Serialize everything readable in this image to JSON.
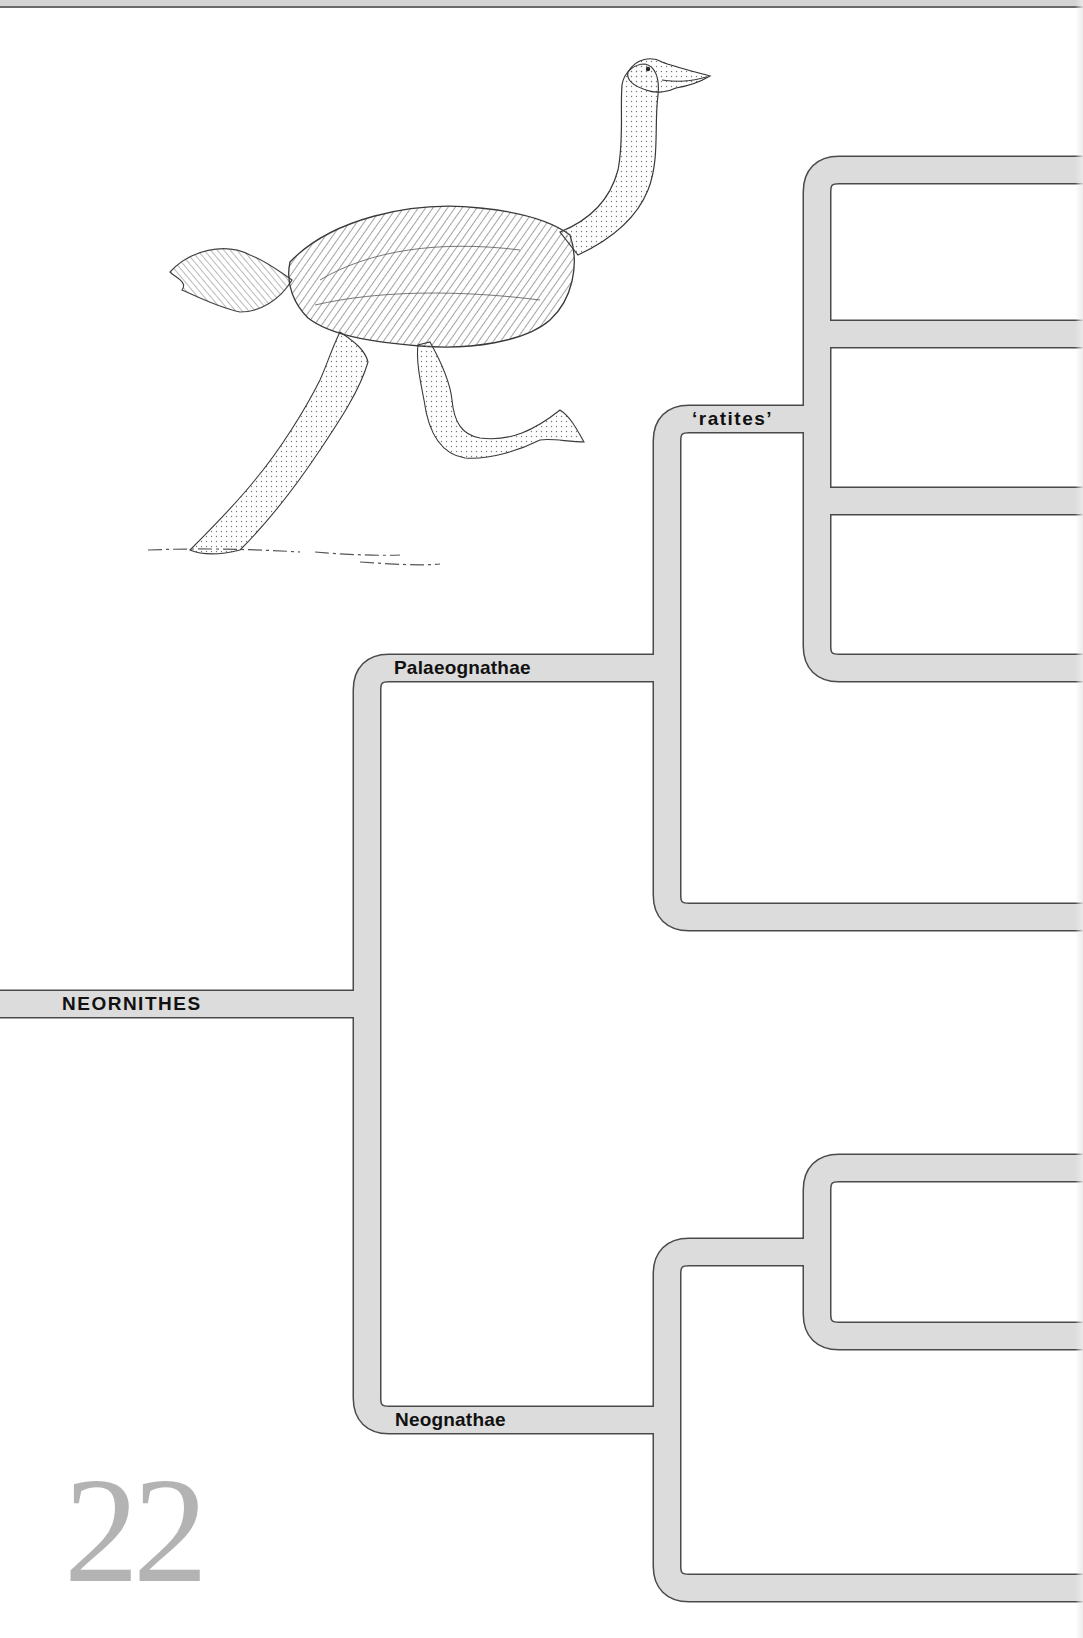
{
  "page": {
    "number": "22",
    "background": "#ffffff"
  },
  "colors": {
    "branch_fill": "#dcdcdc",
    "branch_outline": "#4a4a4a",
    "label_text": "#111111",
    "page_number": "#b3b3b3"
  },
  "illustration": {
    "subject": "running ratite bird (ostrich-like) pen-and-ink drawing",
    "icon": "bird-illustration"
  },
  "cladogram": {
    "root": {
      "label": "NEORNITHES"
    },
    "clades": [
      {
        "id": "palaeognathae",
        "label": "Palaeognathae"
      },
      {
        "id": "ratites",
        "label": "‘ratites’"
      },
      {
        "id": "neognathae",
        "label": "Neognathae"
      }
    ],
    "band_width": 26,
    "corner_radius": 22,
    "geometry": {
      "root_stem": {
        "x1": 0,
        "x2": 367,
        "y": 1004
      },
      "nodes": [
        {
          "id": "neornithes",
          "x": 367,
          "top": 668,
          "bottom": 1420
        },
        {
          "id": "palaeognathae",
          "x": 667,
          "top": 419,
          "bottom": 917
        },
        {
          "id": "ratites",
          "x": 817,
          "top": 170,
          "bottom": 668
        },
        {
          "id": "neognathae",
          "x": 667,
          "top": 1252,
          "bottom": 1588
        },
        {
          "id": "neognathae_inner",
          "x": 817,
          "top": 1168,
          "bottom": 1336
        }
      ],
      "terminals_y": [
        170,
        334,
        501,
        668,
        917,
        1168,
        1336,
        1588
      ],
      "terminal_x_end": 1083
    }
  }
}
